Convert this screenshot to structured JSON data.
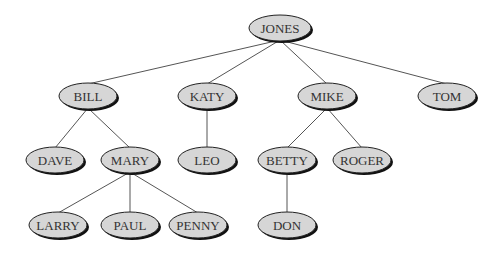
{
  "diagram": {
    "type": "tree",
    "colors": {
      "node_fill": "#d6d6d6",
      "node_stroke": "#222222",
      "shadow": "#111111",
      "edge": "#555555",
      "text": "#333333"
    },
    "nodes": [
      {
        "id": "jones",
        "label": "JONES",
        "x": 280,
        "y": 28,
        "rx": 31,
        "ry": 13
      },
      {
        "id": "bill",
        "label": "BILL",
        "x": 88,
        "y": 96,
        "rx": 29,
        "ry": 13
      },
      {
        "id": "katy",
        "label": "KATY",
        "x": 207,
        "y": 96,
        "rx": 29,
        "ry": 13
      },
      {
        "id": "mike",
        "label": "MIKE",
        "x": 327,
        "y": 96,
        "rx": 29,
        "ry": 13
      },
      {
        "id": "tom",
        "label": "TOM",
        "x": 447,
        "y": 96,
        "rx": 29,
        "ry": 13
      },
      {
        "id": "dave",
        "label": "DAVE",
        "x": 55,
        "y": 160,
        "rx": 29,
        "ry": 13
      },
      {
        "id": "mary",
        "label": "MARY",
        "x": 130,
        "y": 160,
        "rx": 29,
        "ry": 13
      },
      {
        "id": "leo",
        "label": "LEO",
        "x": 207,
        "y": 160,
        "rx": 29,
        "ry": 13
      },
      {
        "id": "betty",
        "label": "BETTY",
        "x": 287,
        "y": 160,
        "rx": 29,
        "ry": 13
      },
      {
        "id": "roger",
        "label": "ROGER",
        "x": 362,
        "y": 160,
        "rx": 29,
        "ry": 13
      },
      {
        "id": "larry",
        "label": "LARRY",
        "x": 58,
        "y": 225,
        "rx": 29,
        "ry": 13
      },
      {
        "id": "paul",
        "label": "PAUL",
        "x": 130,
        "y": 225,
        "rx": 29,
        "ry": 13
      },
      {
        "id": "penny",
        "label": "PENNY",
        "x": 198,
        "y": 225,
        "rx": 29,
        "ry": 13
      },
      {
        "id": "don",
        "label": "DON",
        "x": 287,
        "y": 225,
        "rx": 29,
        "ry": 13
      }
    ],
    "edges": [
      {
        "from": "jones",
        "to": "bill"
      },
      {
        "from": "jones",
        "to": "katy"
      },
      {
        "from": "jones",
        "to": "mike"
      },
      {
        "from": "jones",
        "to": "tom"
      },
      {
        "from": "bill",
        "to": "dave"
      },
      {
        "from": "bill",
        "to": "mary"
      },
      {
        "from": "katy",
        "to": "leo"
      },
      {
        "from": "mike",
        "to": "betty"
      },
      {
        "from": "mike",
        "to": "roger"
      },
      {
        "from": "mary",
        "to": "larry"
      },
      {
        "from": "mary",
        "to": "paul"
      },
      {
        "from": "mary",
        "to": "penny"
      },
      {
        "from": "betty",
        "to": "don"
      }
    ]
  }
}
